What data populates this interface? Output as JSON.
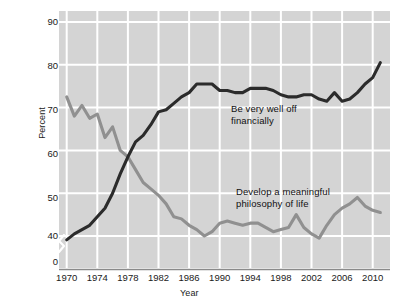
{
  "chart_data": {
    "type": "line",
    "title": "",
    "xlabel": "Year",
    "ylabel": "Percent",
    "xlim": [
      1969,
      2011.5
    ],
    "ylim": [
      35,
      92
    ],
    "yticks": [
      90,
      80,
      70,
      60,
      50,
      40,
      0
    ],
    "xticks": [
      1970,
      1974,
      1978,
      1982,
      1986,
      1990,
      1994,
      1998,
      2002,
      2006,
      2010
    ],
    "grid": true,
    "legend_position": "inline-annotations",
    "axis_break": "y-axis broken between 0 and 40",
    "plot_background": "#d4d4d4",
    "gridline_color": "#ffffff",
    "series": [
      {
        "name": "Be very well off financially",
        "color": "#2b2b2b",
        "annotation": "Be very well off\nfinancially",
        "x": [
          1970,
          1971,
          1972,
          1973,
          1974,
          1975,
          1976,
          1977,
          1978,
          1979,
          1980,
          1981,
          1982,
          1983,
          1984,
          1985,
          1986,
          1987,
          1988,
          1989,
          1990,
          1991,
          1992,
          1993,
          1994,
          1995,
          1996,
          1997,
          1998,
          1999,
          2000,
          2001,
          2002,
          2003,
          2004,
          2005,
          2006,
          2007,
          2008,
          2009,
          2010,
          2011
        ],
        "values": [
          39.1,
          40.5,
          41.5,
          42.5,
          44.5,
          46.5,
          50.0,
          54.5,
          58.5,
          62.0,
          63.5,
          66.0,
          69.0,
          69.5,
          71.0,
          72.5,
          73.5,
          75.5,
          75.5,
          75.5,
          74.0,
          74.0,
          73.5,
          73.5,
          74.5,
          74.5,
          74.5,
          74.0,
          73.0,
          72.5,
          72.5,
          73.0,
          73.0,
          72.0,
          71.5,
          73.5,
          71.5,
          72.0,
          73.5,
          75.5,
          77.0,
          80.5
        ]
      },
      {
        "name": "Develop a meaningful philosophy of life",
        "color": "#909090",
        "annotation": "Develop a meaningful\nphilosophy of life",
        "x": [
          1970,
          1971,
          1972,
          1973,
          1974,
          1975,
          1976,
          1977,
          1978,
          1979,
          1980,
          1981,
          1982,
          1983,
          1984,
          1985,
          1986,
          1987,
          1988,
          1989,
          1990,
          1991,
          1992,
          1993,
          1994,
          1995,
          1996,
          1997,
          1998,
          1999,
          2000,
          2001,
          2002,
          2003,
          2004,
          2005,
          2006,
          2007,
          2008,
          2009,
          2010,
          2011
        ],
        "values": [
          72.5,
          68.0,
          70.5,
          67.5,
          68.5,
          63.0,
          65.5,
          60.0,
          58.5,
          55.5,
          52.5,
          51.0,
          49.5,
          47.5,
          44.5,
          44.0,
          42.5,
          41.5,
          40.0,
          41.0,
          43.0,
          43.5,
          43.0,
          42.5,
          43.0,
          43.0,
          42.0,
          41.0,
          41.5,
          42.0,
          45.0,
          42.0,
          40.5,
          39.5,
          42.5,
          45.0,
          46.5,
          47.5,
          49.0,
          47.0,
          46.0,
          45.5
        ]
      }
    ]
  },
  "axes": {
    "ylabel": "Percent",
    "xlabel": "Year"
  }
}
